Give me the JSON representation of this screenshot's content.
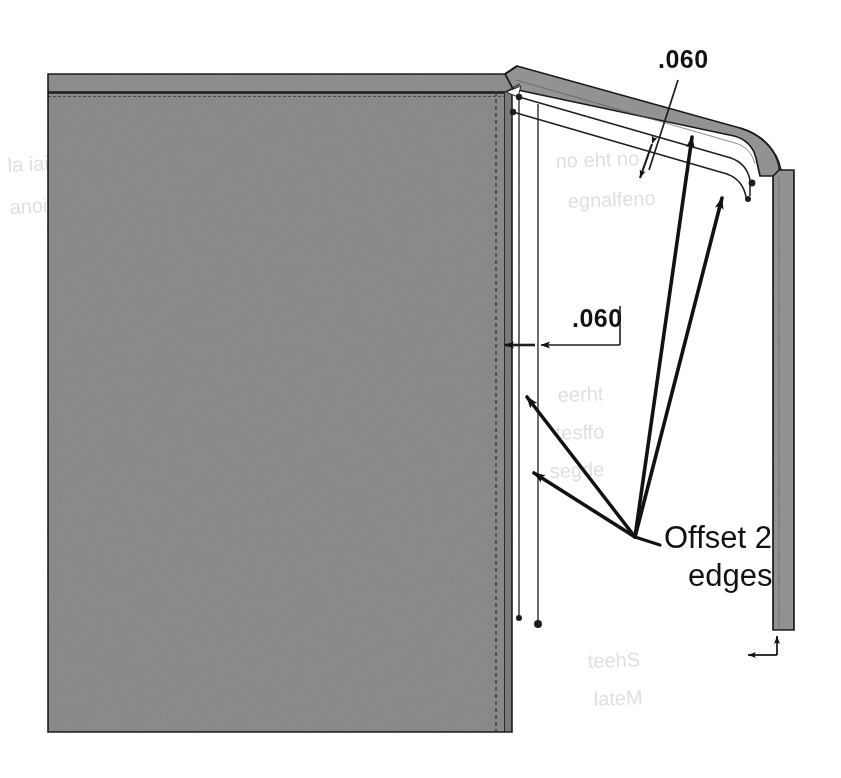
{
  "figure": {
    "kind": "cad-technical-drawing",
    "background_color": "#ffffff",
    "body_fill": "#8a8a8a",
    "flange_fill": "#949494",
    "edge_color": "#1a1a1a",
    "annotation_color": "#121212"
  },
  "annotations": {
    "thickness_top": {
      "label": ".060",
      "x": 658,
      "y": 68,
      "leader_from": [
        678,
        78
      ],
      "leader_to": [
        648,
        172
      ]
    },
    "offset_dimension": {
      "label": ".060",
      "x": 572,
      "y": 327,
      "extension_x": 620,
      "dim_line_y": 345
    },
    "callout_note": {
      "line1": "Offset 2",
      "line2": "edges",
      "x": 662,
      "y1": 545,
      "y2": 583
    }
  },
  "leaders": {
    "origin": [
      635,
      537
    ],
    "arrow_targets": [
      [
        521,
        393
      ],
      [
        528,
        470
      ],
      [
        689,
        131
      ],
      [
        720,
        192
      ]
    ],
    "small_tick_arrow": [
      645,
      165
    ]
  },
  "geometry": {
    "body_panel": {
      "x": 48,
      "y": 74,
      "width": 464,
      "height": 658
    },
    "right_flange": {
      "x": 773,
      "y": 170,
      "width": 21,
      "height": 460
    },
    "corner_radius": 28,
    "bottom_dim_marker": {
      "x": 745,
      "y": 640,
      "width": 32,
      "height": 16
    }
  },
  "ghost_text": [
    {
      "text": "Clearance",
      "x": 8,
      "y": 170,
      "rotate": -3
    },
    {
      "text": "distance",
      "x": 12,
      "y": 212,
      "rotate": -3
    },
    {
      "text": "Offset the wall",
      "x": 560,
      "y": 165,
      "rotate": -2
    },
    {
      "text": "and flange",
      "x": 572,
      "y": 205,
      "rotate": -2
    },
    {
      "text": "Create a",
      "x": 560,
      "y": 400,
      "rotate": -2
    },
    {
      "text": "offset 2",
      "x": 558,
      "y": 437,
      "rotate": -2
    },
    {
      "text": "the edges",
      "x": 552,
      "y": 474,
      "rotate": -2
    },
    {
      "text": "Sheet",
      "x": 590,
      "y": 665,
      "rotate": -2
    },
    {
      "text": "Metal",
      "x": 596,
      "y": 702,
      "rotate": -2
    }
  ]
}
